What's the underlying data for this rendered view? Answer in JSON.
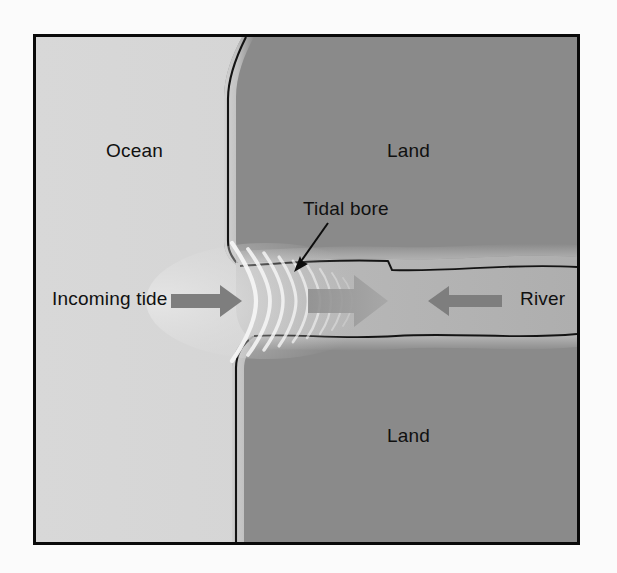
{
  "figure": {
    "type": "diagram",
    "frame_border_color": "#0a0a0a",
    "background_color": "#fbfbfb"
  },
  "regions": {
    "ocean": {
      "label": "Ocean",
      "color": "#d6d6d6"
    },
    "land_north": {
      "label": "Land",
      "color": "#8a8a8a"
    },
    "land_south": {
      "label": "Land",
      "color": "#8a8a8a"
    },
    "river_channel": {
      "color": "#b2b2b2"
    },
    "shoreline_band": {
      "color": "#c2c2c2"
    },
    "outline_color": "#111111"
  },
  "annotations": {
    "tidal_bore": {
      "label": "Tidal bore",
      "leader_line": true,
      "leader_color": "#0d0d0d"
    },
    "incoming_tide": {
      "label": "Incoming tide",
      "arrow_direction": "right",
      "arrow_color": "#7b7b7b"
    },
    "river": {
      "label": "River",
      "arrow_direction": "left",
      "arrow_color": "#7b7b7b"
    },
    "bore_flow": {
      "arrow_direction": "right",
      "arrow_color": "#9b9b9b"
    }
  },
  "wave_front": {
    "description": "Concentric wave crests of the tidal bore advancing up the river mouth",
    "crest_color": "#f2f2f2",
    "crest_count": 9
  }
}
